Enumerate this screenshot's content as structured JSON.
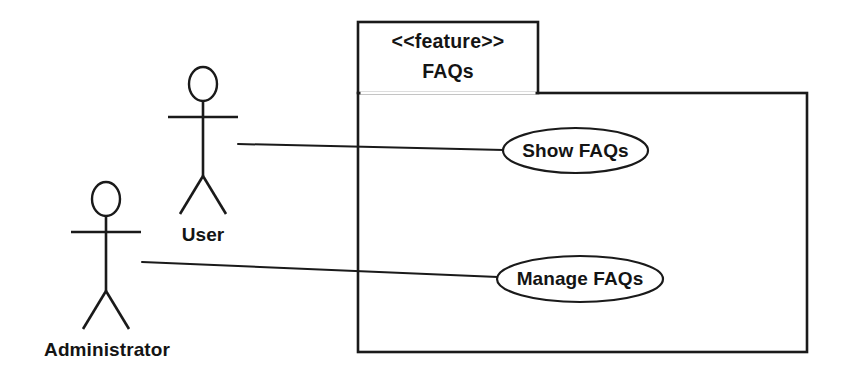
{
  "diagram": {
    "kind": "uml-use-case-diagram",
    "background": "#ffffff",
    "ink_color": "#1a1a1a",
    "package": {
      "stereotype": "<<feature>>",
      "name": "FAQs",
      "tab": {
        "x": 358,
        "y": 22,
        "width": 180,
        "height": 71
      },
      "body": {
        "x": 358,
        "y": 93,
        "width": 449,
        "height": 259
      }
    },
    "use_cases": [
      {
        "id": "show-faqs",
        "label": "Show FAQs",
        "cx": 575.5,
        "cy": 150.5,
        "rx": 72.5,
        "ry": 22.5
      },
      {
        "id": "manage-faqs",
        "label": "Manage FAQs",
        "cx": 580,
        "cy": 279,
        "rx": 83,
        "ry": 23
      }
    ],
    "actors": [
      {
        "id": "user",
        "label": "User",
        "label_x": 203,
        "label_y": 236,
        "head": {
          "cx": 203,
          "cy": 84,
          "rx": 14,
          "ry": 17
        },
        "spine": {
          "x1": 203,
          "y1": 101,
          "x2": 203,
          "y2": 176
        },
        "arms": {
          "x1": 168,
          "y1": 117,
          "x2": 238,
          "y2": 117
        },
        "leg_left": {
          "x1": 203,
          "y1": 176,
          "x2": 180,
          "y2": 214
        },
        "leg_right": {
          "x1": 203,
          "y1": 176,
          "x2": 226,
          "y2": 214
        }
      },
      {
        "id": "administrator",
        "label": "Administrator",
        "label_x": 107,
        "label_y": 351,
        "head": {
          "cx": 106,
          "cy": 199,
          "rx": 14,
          "ry": 17
        },
        "spine": {
          "x1": 106,
          "y1": 216,
          "x2": 106,
          "y2": 291
        },
        "arms": {
          "x1": 71,
          "y1": 232,
          "x2": 141,
          "y2": 232
        },
        "leg_left": {
          "x1": 106,
          "y1": 291,
          "x2": 83,
          "y2": 329
        },
        "leg_right": {
          "x1": 106,
          "y1": 291,
          "x2": 129,
          "y2": 329
        }
      }
    ],
    "associations": [
      {
        "id": "user-show-faqs",
        "from": "user",
        "to": "show-faqs",
        "x1": 238,
        "y1": 144,
        "x2": 504,
        "y2": 150
      },
      {
        "id": "administrator-manage-faqs",
        "from": "administrator",
        "to": "manage-faqs",
        "x1": 142,
        "y1": 262,
        "x2": 498,
        "y2": 277
      }
    ]
  }
}
